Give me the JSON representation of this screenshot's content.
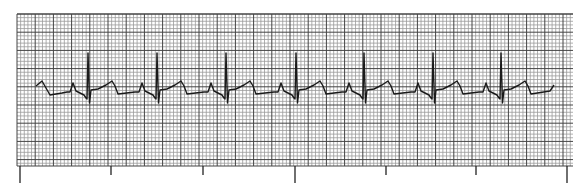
{
  "strip": {
    "grid": {
      "left": 17,
      "top": 14,
      "right": 573,
      "bottom": 166,
      "small_box_px": 3.64,
      "large_every": 5,
      "minor_color": "#9a9a9a",
      "major_color": "#444444",
      "background": "#ffffff"
    },
    "time_ticks": [
      {
        "x": 20,
        "length": "long"
      },
      {
        "x": 111,
        "length": "short"
      },
      {
        "x": 203,
        "length": "short"
      },
      {
        "x": 295,
        "length": "long"
      },
      {
        "x": 386,
        "length": "short"
      },
      {
        "x": 476,
        "length": "short"
      },
      {
        "x": 567,
        "length": "long"
      }
    ],
    "tick_colors": {
      "stroke": "#222222"
    },
    "trace": {
      "color": "#1a1a1a",
      "baseline_y": 93,
      "r_peaks_x": [
        88,
        157,
        226,
        296,
        364,
        433,
        501
      ],
      "start": [
        36,
        86
      ],
      "end": [
        554,
        85
      ]
    }
  }
}
